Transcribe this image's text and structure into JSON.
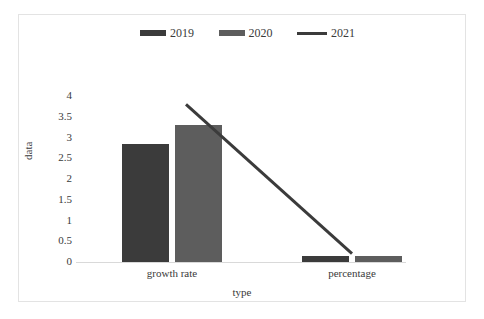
{
  "chart_data": {
    "type": "bar",
    "title": "",
    "xlabel": "type",
    "ylabel": "data",
    "categories": [
      "growth rate",
      "percentage"
    ],
    "ylim": [
      0,
      4
    ],
    "yticks": [
      "4",
      "3.5",
      "3",
      "2.5",
      "2",
      "1.5",
      "1",
      "0.5",
      "0"
    ],
    "ytick_values": [
      4,
      3.5,
      3,
      2.5,
      2,
      1.5,
      1,
      0.5,
      0
    ],
    "grid": false,
    "legend_position": "top-center",
    "series": [
      {
        "name": "2019",
        "type": "bar",
        "color": "#3b3b3b",
        "values": [
          2.85,
          0.15
        ]
      },
      {
        "name": "2020",
        "type": "bar",
        "color": "#5d5d5d",
        "values": [
          3.3,
          0.15
        ]
      },
      {
        "name": "2021",
        "type": "line",
        "color": "#3b3b3b",
        "values": [
          3.8,
          0.2
        ]
      }
    ]
  },
  "legend": {
    "entries": [
      {
        "label": "2019",
        "marker": "bar-swatch",
        "color": "#3b3b3b"
      },
      {
        "label": "2020",
        "marker": "bar-swatch",
        "color": "#5d5d5d"
      },
      {
        "label": "2021",
        "marker": "line-swatch",
        "color": "#3b3b3b"
      }
    ]
  },
  "axes": {
    "y_title": "data",
    "x_title": "type",
    "y_tick_labels": [
      "4",
      "3.5",
      "3",
      "2.5",
      "2",
      "1.5",
      "1",
      "0.5",
      "0"
    ],
    "x_tick_labels": [
      "growth rate",
      "percentage"
    ]
  }
}
